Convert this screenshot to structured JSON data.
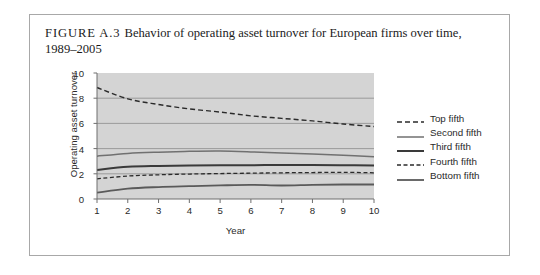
{
  "caption": {
    "figure_label": "FIGURE A.3",
    "text": "Behavior of operating asset turnover for European firms over time, 1989–2005"
  },
  "colors": {
    "plot_background": "#d4d4d4",
    "frame_border": "#a8a8a8",
    "axis": "#6e6e6e",
    "gridline": "#8c8c8c",
    "top_fifth": "#2a2a2a",
    "second_fifth": "#707070",
    "third_fifth": "#3a3a3a",
    "fourth_fifth": "#2a2a2a",
    "bottom_fifth": "#5a5a5a"
  },
  "chart_data": {
    "type": "line",
    "title": "Behavior of operating asset turnover for European firms over time, 1989–2005",
    "xlabel": "Year",
    "ylabel": "Operating asset turnover",
    "x": [
      1,
      2,
      3,
      4,
      5,
      6,
      7,
      8,
      9,
      10
    ],
    "xticks": [
      "1",
      "2",
      "3",
      "4",
      "5",
      "6",
      "7",
      "8",
      "9",
      "10"
    ],
    "yticks": [
      "0",
      "2",
      "4",
      "6",
      "8",
      "10"
    ],
    "ytick_values": [
      0,
      2,
      4,
      6,
      8,
      10
    ],
    "xlim": [
      1,
      10
    ],
    "ylim": [
      0,
      10
    ],
    "grid": "horizontal",
    "gridline_values": [
      2,
      4,
      6,
      8
    ],
    "legend_position": "right",
    "series": [
      {
        "name": "Top fifth",
        "style": "dashed",
        "width": 1.4,
        "dash": "5,3",
        "color": "#2a2a2a",
        "values": [
          8.85,
          7.95,
          7.5,
          7.15,
          6.9,
          6.6,
          6.4,
          6.2,
          5.95,
          5.75
        ]
      },
      {
        "name": "Second fifth",
        "style": "solid",
        "width": 1.5,
        "dash": "none",
        "color": "#707070",
        "values": [
          3.4,
          3.62,
          3.72,
          3.78,
          3.8,
          3.74,
          3.65,
          3.58,
          3.48,
          3.35
        ]
      },
      {
        "name": "Third fifth",
        "style": "solid",
        "width": 2.0,
        "dash": "none",
        "color": "#3a3a3a",
        "values": [
          2.3,
          2.55,
          2.62,
          2.65,
          2.67,
          2.68,
          2.7,
          2.7,
          2.68,
          2.65
        ]
      },
      {
        "name": "Fourth fifth",
        "style": "dashed",
        "width": 1.3,
        "dash": "4,2.5",
        "color": "#2a2a2a",
        "values": [
          1.6,
          1.82,
          1.92,
          1.98,
          2.02,
          2.05,
          2.08,
          2.1,
          2.12,
          2.08
        ]
      },
      {
        "name": "Bottom fifth",
        "style": "solid",
        "width": 1.8,
        "dash": "none",
        "color": "#5a5a5a",
        "values": [
          0.5,
          0.82,
          0.95,
          1.02,
          1.08,
          1.12,
          1.07,
          1.12,
          1.15,
          1.15
        ]
      }
    ]
  }
}
